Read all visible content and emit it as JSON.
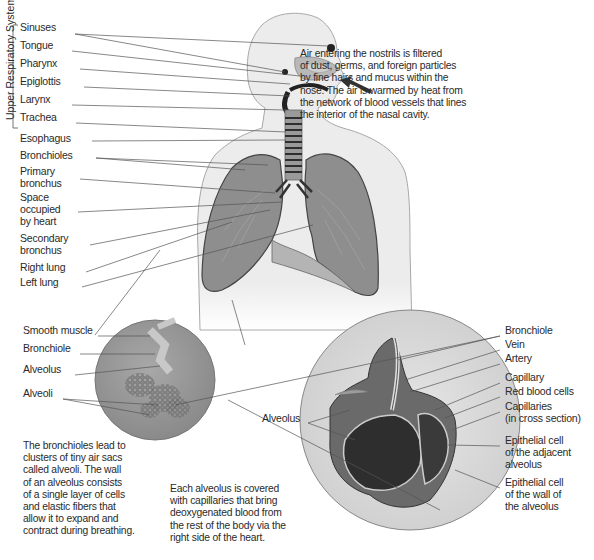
{
  "system_bracket_label": "Upper Respiratory System",
  "left_labels": [
    {
      "text": "Sinuses",
      "x": 20,
      "y": 27
    },
    {
      "text": "Tongue",
      "x": 20,
      "y": 45
    },
    {
      "text": "Pharynx",
      "x": 20,
      "y": 63
    },
    {
      "text": "Epiglottis",
      "x": 20,
      "y": 81
    },
    {
      "text": "Larynx",
      "x": 20,
      "y": 99
    },
    {
      "text": "Trachea",
      "x": 20,
      "y": 117
    },
    {
      "text": "Esophagus",
      "x": 20,
      "y": 138
    },
    {
      "text": "Bronchioles",
      "x": 20,
      "y": 155
    },
    {
      "text": "Primary",
      "x": 20,
      "y": 171
    },
    {
      "text": "bronchus",
      "x": 20,
      "y": 183
    },
    {
      "text": "Space",
      "x": 20,
      "y": 197
    },
    {
      "text": "occupied",
      "x": 20,
      "y": 209
    },
    {
      "text": "by heart",
      "x": 20,
      "y": 221
    },
    {
      "text": "Secondary",
      "x": 20,
      "y": 238
    },
    {
      "text": "bronchus",
      "x": 20,
      "y": 250
    },
    {
      "text": "Right lung",
      "x": 20,
      "y": 267
    },
    {
      "text": "Left lung",
      "x": 20,
      "y": 282
    }
  ],
  "nasal_note": [
    "Air entering the nostrils is filtered",
    "of dust, germs, and foreign particles",
    "by fine hairs and mucus within the",
    "nose. The air is warmed by heat from",
    "the network of blood vessels that lines",
    "the interior of the nasal cavity."
  ],
  "alveoli_labels": [
    {
      "text": "Smooth muscle",
      "x": 23,
      "y": 330
    },
    {
      "text": "Bronchiole",
      "x": 23,
      "y": 348
    },
    {
      "text": "Alveolus",
      "x": 23,
      "y": 369
    },
    {
      "text": "Alveoli",
      "x": 23,
      "y": 393
    }
  ],
  "bronchioles_note": [
    "The bronchioles lead to",
    "clusters of tiny air sacs",
    "called alveoli. The wall",
    "of an alveolus consists",
    "of a single layer of cells",
    "and elastic fibers that",
    "allow it to expand and",
    "contract during breathing."
  ],
  "capillary_note": [
    "Each alveolus is covered",
    "with capillaries that bring",
    "deoxygenated blood from",
    "the rest of the body via the",
    "right side of the heart."
  ],
  "right_labels": [
    {
      "text": "Bronchiole",
      "x": 505,
      "y": 330
    },
    {
      "text": "Vein",
      "x": 505,
      "y": 344
    },
    {
      "text": "Artery",
      "x": 505,
      "y": 358
    },
    {
      "text": "Capillary",
      "x": 505,
      "y": 377
    },
    {
      "text": "Red blood cells",
      "x": 505,
      "y": 391
    },
    {
      "text": "Capillaries",
      "x": 505,
      "y": 406
    },
    {
      "text": "(in cross section)",
      "x": 505,
      "y": 418
    },
    {
      "text": "Epithelial cell",
      "x": 505,
      "y": 440
    },
    {
      "text": "of the adjacent",
      "x": 505,
      "y": 452
    },
    {
      "text": "alveolus",
      "x": 505,
      "y": 464
    },
    {
      "text": "Epithelial cell",
      "x": 505,
      "y": 482
    },
    {
      "text": "of the wall of",
      "x": 505,
      "y": 494
    },
    {
      "text": "the alveolus",
      "x": 505,
      "y": 506
    }
  ],
  "alveolus_inner_label": {
    "text": "Alveolus",
    "x": 262,
    "y": 418
  },
  "colors": {
    "body_fill": "#ececec",
    "body_stroke": "#9a9a9a",
    "lung_fill": "#8c8c8c",
    "lung_dark": "#6e6e6e",
    "airway_dark": "#333333",
    "circle_fill": "#9a9a9a",
    "circle_right_fill": "#d8d8d8",
    "leader_line": "#555555"
  }
}
